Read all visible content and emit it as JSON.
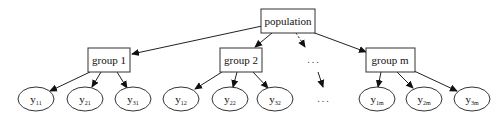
{
  "diagram": {
    "type": "tree",
    "root": {
      "id": "population",
      "label": "population"
    },
    "groups": [
      {
        "id": "group1",
        "label": "group 1",
        "children": [
          {
            "id": "y11",
            "base": "y",
            "sub": "11"
          },
          {
            "id": "y21",
            "base": "y",
            "sub": "21"
          },
          {
            "id": "y31",
            "base": "y",
            "sub": "31"
          }
        ]
      },
      {
        "id": "group2",
        "label": "group 2",
        "children": [
          {
            "id": "y12",
            "base": "y",
            "sub": "12"
          },
          {
            "id": "y22",
            "base": "y",
            "sub": "22"
          },
          {
            "id": "y32",
            "base": "y",
            "sub": "32"
          }
        ]
      },
      {
        "id": "ellipsis-group",
        "label": "...",
        "children": [
          {
            "id": "ellipsis-leaf",
            "label": "..."
          }
        ]
      },
      {
        "id": "groupm",
        "label": "group m",
        "children": [
          {
            "id": "y1m",
            "base": "y",
            "sub": "1m"
          },
          {
            "id": "y2m",
            "base": "y",
            "sub": "2m"
          },
          {
            "id": "y3m",
            "base": "y",
            "sub": "3m"
          }
        ]
      }
    ],
    "edges": [
      {
        "from": "population",
        "to": "group1",
        "style": "solid"
      },
      {
        "from": "population",
        "to": "group2",
        "style": "solid"
      },
      {
        "from": "population",
        "to": "ellipsis-group",
        "style": "dashed"
      },
      {
        "from": "population",
        "to": "groupm",
        "style": "solid"
      },
      {
        "from": "group1",
        "to": "y11",
        "style": "solid"
      },
      {
        "from": "group1",
        "to": "y21",
        "style": "solid"
      },
      {
        "from": "group1",
        "to": "y31",
        "style": "solid"
      },
      {
        "from": "group2",
        "to": "y12",
        "style": "solid"
      },
      {
        "from": "group2",
        "to": "y22",
        "style": "solid"
      },
      {
        "from": "group2",
        "to": "y32",
        "style": "solid"
      },
      {
        "from": "ellipsis-group",
        "to": "ellipsis-leaf",
        "style": "solid"
      },
      {
        "from": "groupm",
        "to": "y1m",
        "style": "solid"
      },
      {
        "from": "groupm",
        "to": "y2m",
        "style": "solid"
      },
      {
        "from": "groupm",
        "to": "y3m",
        "style": "solid"
      }
    ]
  },
  "labels": {
    "population": "population",
    "group1": "group 1",
    "group2": "group 2",
    "groupm": "group m",
    "dots": "...",
    "y_base": "y",
    "y11": "11",
    "y21": "21",
    "y31": "31",
    "y12": "12",
    "y22": "22",
    "y32": "32",
    "y1m": "1m",
    "y2m": "2m",
    "y3m": "3m"
  },
  "colors": {
    "stroke": "#333333",
    "background": "#ffffff",
    "text": "#111111"
  }
}
